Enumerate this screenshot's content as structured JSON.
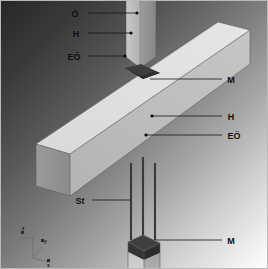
{
  "figure": {
    "background": {
      "gradient_from": "#2a2a2a",
      "gradient_to": "#ffffff",
      "direction": "top-left-dark to bottom-right-light"
    },
    "colors": {
      "concrete_light": "#d5d5d5",
      "concrete_mid": "#b3b3b3",
      "concrete_dark": "#8f8f8f",
      "mortar": "#3a3a3a",
      "rebar": "#3a3a3a",
      "label_text": "#101010",
      "leader_line": "#141414"
    }
  },
  "labels": {
    "upper_column": [
      {
        "id": "label-o",
        "text": "Ö",
        "x": 75,
        "y": 14,
        "dot_x": 137,
        "dot_y": 13,
        "line_x1": 88,
        "line_y1": 13
      },
      {
        "id": "label-h-top",
        "text": "H",
        "x": 76,
        "y": 34,
        "dot_x": 131,
        "dot_y": 33,
        "line_x1": 88,
        "line_y1": 33
      },
      {
        "id": "label-eo-top",
        "text": "EÖ",
        "x": 69,
        "y": 57,
        "dot_x": 125,
        "dot_y": 56,
        "line_x1": 88,
        "line_y1": 56
      }
    ],
    "beam_right": [
      {
        "id": "label-m-top",
        "text": "M",
        "x": 228,
        "y": 82,
        "dot_x": 150,
        "dot_y": 79,
        "line_x1": 222,
        "line_y1": 79
      },
      {
        "id": "label-h-beam",
        "text": "H",
        "x": 228,
        "y": 118,
        "dot_x": 152,
        "dot_y": 116,
        "line_x1": 222,
        "line_y1": 116
      },
      {
        "id": "label-eo-beam",
        "text": "EÖ",
        "x": 228,
        "y": 136,
        "dot_x": 146,
        "dot_y": 135,
        "line_x1": 222,
        "line_y1": 135
      }
    ],
    "lower": [
      {
        "id": "label-st",
        "text": "St",
        "x": 76,
        "y": 203,
        "dot_x": 131,
        "dot_y": 200,
        "line_x1": 92,
        "line_y1": 200
      },
      {
        "id": "label-m-bottom",
        "text": "M",
        "x": 228,
        "y": 243,
        "dot_x": 156,
        "dot_y": 240,
        "line_x1": 222,
        "line_y1": 240
      }
    ]
  },
  "axis_triad": {
    "origin_label": "",
    "axes": [
      {
        "name": "z-axis",
        "label": "z",
        "label_x": 20,
        "label_y": 236
      },
      {
        "name": "y-axis",
        "label": "y",
        "label_x": 44,
        "label_y": 243
      },
      {
        "name": "x-axis",
        "label": "x",
        "label_x": 49,
        "label_y": 264
      }
    ]
  },
  "legend_keys": {
    "O": "Ö",
    "H": "H",
    "EO": "EÖ",
    "M": "M",
    "St": "St"
  },
  "geometry": {
    "elements": [
      {
        "name": "upper-column",
        "description": "vertical column above joint"
      },
      {
        "name": "beam",
        "description": "diagonal horizontal beam"
      },
      {
        "name": "mortar-joint-top",
        "description": "dark diamond on beam top"
      },
      {
        "name": "rebar-group",
        "description": "three vertical starter bars",
        "count": 3
      },
      {
        "name": "lower-column",
        "description": "column below with dark mortar cap"
      }
    ]
  }
}
